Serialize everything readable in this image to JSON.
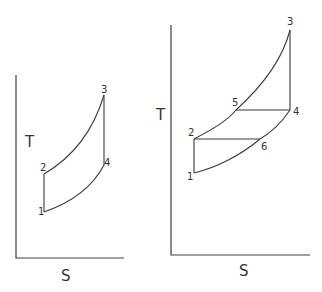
{
  "diagrams": [
    {
      "id": "left",
      "title": "Simple Brayton cycle T-S diagram",
      "axis_labels": {
        "y": "T",
        "x": "S"
      },
      "points": [
        {
          "label": "1"
        },
        {
          "label": "2"
        },
        {
          "label": "3"
        },
        {
          "label": "4"
        }
      ]
    },
    {
      "id": "right",
      "title": "Regenerative Brayton cycle T-S diagram",
      "axis_labels": {
        "y": "T",
        "x": "S"
      },
      "points": [
        {
          "label": "1"
        },
        {
          "label": "2"
        },
        {
          "label": "3"
        },
        {
          "label": "4"
        },
        {
          "label": "5"
        },
        {
          "label": "6"
        }
      ]
    }
  ],
  "colors": {
    "line": "#3a3a3a",
    "background": "#ffffff"
  }
}
